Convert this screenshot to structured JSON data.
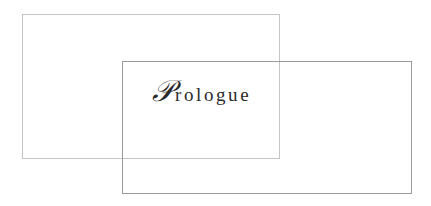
{
  "title": {
    "initial": "𝒫",
    "rest": "rologue"
  }
}
